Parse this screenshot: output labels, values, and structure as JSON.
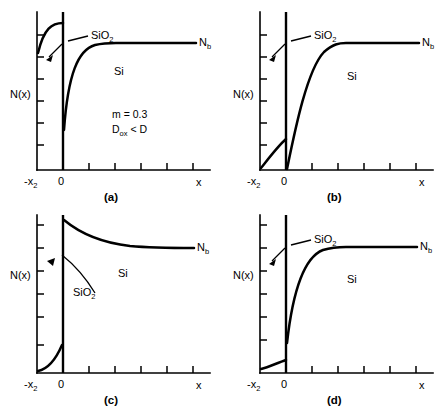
{
  "figure": {
    "axis_labels": {
      "y": "N(x)",
      "x": "x",
      "x_origin": "0",
      "x_left": "-x",
      "x_left_sub": "2"
    },
    "region_labels": {
      "oxide": "SiO",
      "oxide_sub": "2",
      "silicon": "Si",
      "bulk": "N",
      "bulk_sub": "b"
    }
  },
  "panels": [
    {
      "id": "a",
      "caption": "(a)",
      "annotations": [
        {
          "text": "m = 0.3"
        },
        {
          "text": "D",
          "sub": "ox",
          "tail": " < D"
        }
      ],
      "oxide_profile": "rises-steeply-then-plateau-high",
      "silicon_profile": "rises-from-low-to-bulk",
      "bulk_level": 0.78,
      "interface_silicon_value": 0.34,
      "oxide_plateau": 0.9
    },
    {
      "id": "b",
      "caption": "(b)",
      "annotations": [],
      "oxide_profile": "linear-rise-to-mid",
      "silicon_profile": "rises-from-zero-to-bulk",
      "bulk_level": 0.78,
      "interface_silicon_value": 0.0,
      "oxide_plateau": 0.3
    },
    {
      "id": "c",
      "caption": "(c)",
      "annotations": [],
      "oxide_profile": "low-rise-near-baseline",
      "silicon_profile": "decays-from-high-to-bulk",
      "bulk_level": 0.66,
      "interface_silicon_value": 0.93,
      "oxide_plateau": 0.14
    },
    {
      "id": "d",
      "caption": "(d)",
      "annotations": [],
      "oxide_profile": "near-flat-slight-rise",
      "silicon_profile": "rises-from-low-to-bulk",
      "bulk_level": 0.78,
      "interface_silicon_value": 0.2,
      "oxide_plateau": 0.09
    }
  ],
  "colors": {
    "line": "#000000",
    "background": "#ffffff"
  }
}
